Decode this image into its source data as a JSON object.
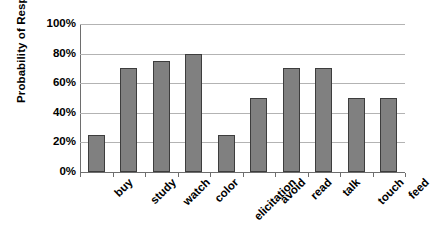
{
  "chart_data": {
    "type": "bar",
    "title": "",
    "subtitle": "",
    "xlabel": "",
    "ylabel": "Probability of Response",
    "categories": [
      "buy",
      "study",
      "watch",
      "color",
      "elicitation",
      "avoid",
      "read",
      "talk",
      "touch",
      "feed"
    ],
    "values": [
      25,
      70,
      75,
      80,
      25,
      50,
      70,
      70,
      50,
      50
    ],
    "value_unit": "%",
    "ylim": [
      0,
      100
    ],
    "ytick_values": [
      0,
      20,
      40,
      60,
      80,
      100
    ],
    "ytick_labels": [
      "0%",
      "20%",
      "40%",
      "60%",
      "80%",
      "100%"
    ],
    "grid": "horizontal",
    "legend": "none",
    "bar_color": "#808080",
    "bar_border_color": "#3d3d3d",
    "gridline_color": "#b3b3b3",
    "axis_color": "#6e6e6e",
    "background_color": "#ffffff",
    "xlabel_rotation_deg": -45
  }
}
